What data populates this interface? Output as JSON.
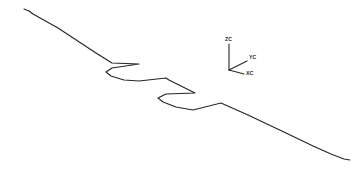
{
  "figure": {
    "background_color": "#ffffff",
    "line_color": "#262626",
    "width": 362,
    "height": 173
  },
  "chart_data": {
    "type": "line",
    "title": "",
    "xlabel": "",
    "ylabel": "",
    "grid": false,
    "legend": false,
    "xlim": [
      0,
      362
    ],
    "ylim": [
      173,
      0
    ],
    "series": [
      {
        "name": "stepped-profile",
        "color": "#262626",
        "closed": false,
        "points": [
          [
            24,
            9
          ],
          [
            29,
            11
          ],
          [
            33,
            14
          ],
          [
            58,
            28
          ],
          [
            96,
            53
          ],
          [
            112,
            63
          ],
          [
            139,
            64
          ],
          [
            112,
            68
          ],
          [
            106,
            72
          ],
          [
            111,
            76
          ],
          [
            124,
            80
          ],
          [
            139,
            81
          ],
          [
            166,
            78
          ],
          [
            169,
            80
          ],
          [
            195,
            93
          ],
          [
            166,
            94
          ],
          [
            158,
            98
          ],
          [
            163,
            102
          ],
          [
            176,
            107
          ],
          [
            193,
            110
          ],
          [
            221,
            103
          ],
          [
            248,
            115
          ],
          [
            286,
            133
          ],
          [
            313,
            146
          ],
          [
            331,
            154
          ],
          [
            344,
            159
          ],
          [
            350,
            160
          ]
        ]
      }
    ],
    "annotations": [
      {
        "name": "coordinate-triad",
        "origin": [
          229,
          70
        ],
        "arms": [
          {
            "axis": "ZC",
            "end": [
              229,
              44
            ],
            "label_pos": [
              225,
              41
            ]
          },
          {
            "axis": "YC",
            "end": [
              247,
              61
            ],
            "label_pos": [
              249,
              59
            ]
          },
          {
            "axis": "XC",
            "end": [
              244,
              74
            ],
            "label_pos": [
              246,
              75
            ]
          }
        ]
      }
    ]
  },
  "triad": {
    "name": "coordinate-system-triad",
    "z_label": "ZC",
    "y_label": "YC",
    "x_label": "XC"
  }
}
